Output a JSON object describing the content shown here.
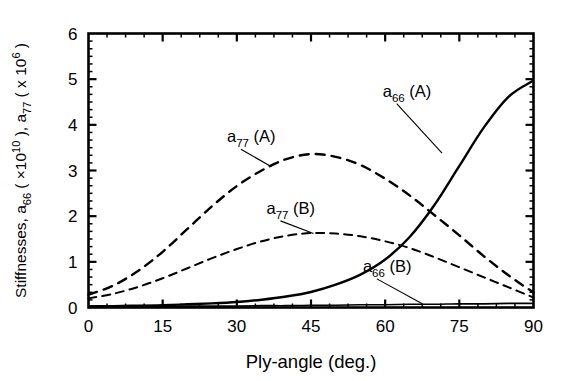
{
  "chart_data": {
    "type": "line",
    "title": "",
    "xlabel": "Ply-angle (deg.)",
    "ylabel": "Stiffnesses,  a66 ( x10^10 ),  a77 ( x 10^6 )",
    "ylabel_parts": {
      "lead": "Stiffnesses,  ",
      "sym1": "a",
      "sub1": "66",
      "paren1_open": " ( ",
      "mult1": "×10",
      "exp1": "10",
      "paren1_close": " ),  ",
      "sym2": "a",
      "sub2": "77",
      "paren2_open": " ( ",
      "mult2": "x 10",
      "exp2": "6",
      "paren2_close": " )"
    },
    "xlim": [
      0,
      90
    ],
    "ylim": [
      0,
      6
    ],
    "xticks": [
      0,
      15,
      30,
      45,
      60,
      75,
      90
    ],
    "yticks": [
      0,
      1,
      2,
      3,
      4,
      5,
      6
    ],
    "xtick_labels": [
      "0",
      "15",
      "30",
      "45",
      "60",
      "75",
      "90"
    ],
    "ytick_labels": [
      "0",
      "1",
      "2",
      "3",
      "4",
      "5",
      "6"
    ],
    "x_minor_per_major": 3,
    "y_minor_per_major": 5,
    "grid": false,
    "legend_position": "inline-annotations",
    "x": [
      0,
      5,
      10,
      15,
      20,
      25,
      30,
      35,
      40,
      45,
      50,
      55,
      60,
      65,
      70,
      75,
      80,
      85,
      90
    ],
    "series": [
      {
        "name": "a66 (A)",
        "label": "a66 (A)",
        "label_sym": "a",
        "label_sub": "66",
        "label_suffix": " (A)",
        "style": "solid",
        "color": "#000000",
        "width": 2.4,
        "values": [
          0.03,
          0.03,
          0.04,
          0.05,
          0.07,
          0.09,
          0.12,
          0.17,
          0.24,
          0.34,
          0.5,
          0.72,
          1.05,
          1.55,
          2.25,
          3.1,
          3.95,
          4.62,
          4.97
        ],
        "annotation": {
          "text_x": 59.5,
          "text_y": 4.62,
          "point_x": 71.5,
          "point_y": 3.38
        }
      },
      {
        "name": "a66 (B)",
        "label": "a66 (B)",
        "label_sym": "a",
        "label_sub": "66",
        "label_suffix": " (B)",
        "style": "solid",
        "color": "#000000",
        "width": 1.6,
        "values": [
          0.02,
          0.02,
          0.02,
          0.02,
          0.03,
          0.03,
          0.03,
          0.04,
          0.04,
          0.05,
          0.05,
          0.06,
          0.06,
          0.07,
          0.07,
          0.08,
          0.08,
          0.09,
          0.09
        ],
        "annotation": {
          "text_x": 55.5,
          "text_y": 0.78,
          "point_x": 67.5,
          "point_y": 0.08
        }
      },
      {
        "name": "a77 (A)",
        "label": "a77 (A)",
        "label_sym": "a",
        "label_sub": "77",
        "label_suffix": " (A)",
        "style": "dashed",
        "color": "#000000",
        "width": 2.4,
        "values": [
          0.28,
          0.48,
          0.8,
          1.22,
          1.72,
          2.22,
          2.66,
          3.0,
          3.25,
          3.36,
          3.3,
          3.12,
          2.82,
          2.45,
          2.02,
          1.58,
          1.12,
          0.7,
          0.33
        ],
        "annotation": {
          "text_x": 28.0,
          "text_y": 3.62,
          "point_x": 37.0,
          "point_y": 3.08
        }
      },
      {
        "name": "a77 (B)",
        "label": "a77 (B)",
        "label_sym": "a",
        "label_sub": "77",
        "label_suffix": " (B)",
        "style": "dashed",
        "color": "#000000",
        "width": 2.0,
        "values": [
          0.2,
          0.3,
          0.45,
          0.64,
          0.86,
          1.08,
          1.28,
          1.45,
          1.57,
          1.63,
          1.62,
          1.56,
          1.45,
          1.3,
          1.1,
          0.88,
          0.66,
          0.44,
          0.22
        ],
        "annotation": {
          "text_x": 36.0,
          "text_y": 2.05,
          "point_x": 45.5,
          "point_y": 1.62
        }
      }
    ]
  },
  "figure": {
    "background": "#ffffff",
    "axis_color": "#000000",
    "text_color": "#000000"
  }
}
